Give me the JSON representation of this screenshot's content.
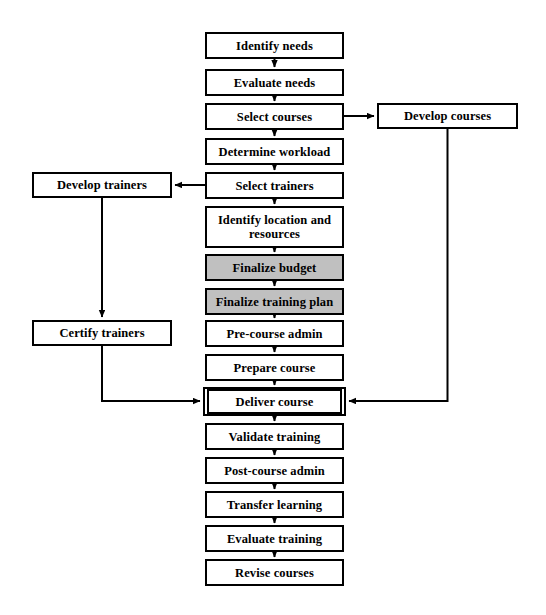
{
  "diagram": {
    "colors": {
      "stroke": "#000000",
      "background": "#ffffff",
      "shaded_fill": "#c0c0c0"
    },
    "main_flow": [
      {
        "id": "identify-needs",
        "label": "Identify needs",
        "style": "plain",
        "x": 205,
        "y": 32,
        "w": 139,
        "h": 27
      },
      {
        "id": "evaluate-needs",
        "label": "Evaluate needs",
        "style": "plain",
        "x": 205,
        "y": 69,
        "w": 139,
        "h": 27
      },
      {
        "id": "select-courses",
        "label": "Select courses",
        "style": "plain",
        "x": 205,
        "y": 103,
        "w": 139,
        "h": 27
      },
      {
        "id": "determine-workload",
        "label": "Determine workload",
        "style": "plain",
        "x": 205,
        "y": 138,
        "w": 139,
        "h": 27
      },
      {
        "id": "select-trainers",
        "label": "Select trainers",
        "style": "plain",
        "x": 205,
        "y": 172,
        "w": 139,
        "h": 27
      },
      {
        "id": "identify-location-and-resources",
        "label": "Identify location and resources",
        "style": "plain",
        "x": 205,
        "y": 206,
        "w": 139,
        "h": 42
      },
      {
        "id": "finalize-budget",
        "label": "Finalize budget",
        "style": "shaded",
        "x": 205,
        "y": 254,
        "w": 139,
        "h": 27
      },
      {
        "id": "finalize-training-plan",
        "label": "Finalize training plan",
        "style": "shaded",
        "x": 205,
        "y": 288,
        "w": 139,
        "h": 27
      },
      {
        "id": "pre-course-admin",
        "label": "Pre-course admin",
        "style": "plain",
        "x": 205,
        "y": 320,
        "w": 139,
        "h": 27
      },
      {
        "id": "prepare-course",
        "label": "Prepare course",
        "style": "plain",
        "x": 205,
        "y": 354,
        "w": 139,
        "h": 27
      },
      {
        "id": "deliver-course",
        "label": "Deliver course",
        "style": "emphasis",
        "x": 203,
        "y": 387,
        "w": 143,
        "h": 29
      },
      {
        "id": "validate-training",
        "label": "Validate training",
        "style": "plain",
        "x": 205,
        "y": 423,
        "w": 139,
        "h": 27
      },
      {
        "id": "post-course-admin",
        "label": "Post-course admin",
        "style": "plain",
        "x": 205,
        "y": 457,
        "w": 139,
        "h": 27
      },
      {
        "id": "transfer-learning",
        "label": "Transfer learning",
        "style": "plain",
        "x": 205,
        "y": 491,
        "w": 139,
        "h": 27
      },
      {
        "id": "evaluate-training",
        "label": "Evaluate training",
        "style": "plain",
        "x": 205,
        "y": 525,
        "w": 139,
        "h": 27
      },
      {
        "id": "revise-courses",
        "label": "Revise courses",
        "style": "plain",
        "x": 205,
        "y": 559,
        "w": 139,
        "h": 27
      }
    ],
    "side_nodes": [
      {
        "id": "develop-courses",
        "label": "Develop courses",
        "style": "plain",
        "side": "right",
        "x": 377,
        "y": 103,
        "w": 141,
        "h": 26
      },
      {
        "id": "develop-trainers",
        "label": "Develop trainers",
        "style": "plain",
        "side": "left",
        "x": 32,
        "y": 172,
        "w": 140,
        "h": 26
      },
      {
        "id": "certify-trainers",
        "label": "Certify trainers",
        "style": "plain",
        "side": "left",
        "x": 32,
        "y": 320,
        "w": 140,
        "h": 26
      }
    ],
    "edges": [
      {
        "id": "identify-needs-to-evaluate-needs",
        "from": "identify-needs",
        "to": "evaluate-needs",
        "kind": "vertical-arrow"
      },
      {
        "id": "evaluate-needs-to-select-courses",
        "from": "evaluate-needs",
        "to": "select-courses",
        "kind": "vertical-arrow"
      },
      {
        "id": "select-courses-to-determine-workload",
        "from": "select-courses",
        "to": "determine-workload",
        "kind": "vertical-arrow"
      },
      {
        "id": "determine-workload-to-select-trainers",
        "from": "determine-workload",
        "to": "select-trainers",
        "kind": "vertical-arrow"
      },
      {
        "id": "select-trainers-to-identify-location",
        "from": "select-trainers",
        "to": "identify-location-and-resources",
        "kind": "vertical-arrow"
      },
      {
        "id": "identify-location-to-finalize-budget",
        "from": "identify-location-and-resources",
        "to": "finalize-budget",
        "kind": "vertical-arrow"
      },
      {
        "id": "finalize-budget-to-finalize-training-plan",
        "from": "finalize-budget",
        "to": "finalize-training-plan",
        "kind": "vertical-arrow"
      },
      {
        "id": "finalize-training-plan-to-pre-course-admin",
        "from": "finalize-training-plan",
        "to": "pre-course-admin",
        "kind": "vertical-arrow"
      },
      {
        "id": "pre-course-admin-to-prepare-course",
        "from": "pre-course-admin",
        "to": "prepare-course",
        "kind": "vertical-arrow"
      },
      {
        "id": "prepare-course-to-deliver-course",
        "from": "prepare-course",
        "to": "deliver-course",
        "kind": "vertical-arrow"
      },
      {
        "id": "deliver-course-to-validate-training",
        "from": "deliver-course",
        "to": "validate-training",
        "kind": "vertical-arrow"
      },
      {
        "id": "validate-training-to-post-course-admin",
        "from": "validate-training",
        "to": "post-course-admin",
        "kind": "vertical-arrow"
      },
      {
        "id": "post-course-admin-to-transfer-learning",
        "from": "post-course-admin",
        "to": "transfer-learning",
        "kind": "vertical-arrow"
      },
      {
        "id": "transfer-learning-to-evaluate-training",
        "from": "transfer-learning",
        "to": "evaluate-training",
        "kind": "vertical-arrow"
      },
      {
        "id": "evaluate-training-to-revise-courses",
        "from": "evaluate-training",
        "to": "revise-courses",
        "kind": "vertical-arrow"
      },
      {
        "id": "select-courses-to-develop-courses",
        "from": "select-courses",
        "to": "develop-courses",
        "kind": "horizontal-arrow-right"
      },
      {
        "id": "select-trainers-to-develop-trainers",
        "from": "select-trainers",
        "to": "develop-trainers",
        "kind": "horizontal-arrow-left"
      },
      {
        "id": "develop-trainers-to-certify-trainers",
        "from": "develop-trainers",
        "to": "certify-trainers",
        "kind": "vertical-arrow"
      },
      {
        "id": "certify-trainers-to-deliver-course",
        "from": "certify-trainers",
        "to": "deliver-course",
        "kind": "elbow-arrow-right"
      },
      {
        "id": "develop-courses-to-deliver-course",
        "from": "develop-courses",
        "to": "deliver-course",
        "kind": "elbow-arrow-left"
      }
    ]
  }
}
